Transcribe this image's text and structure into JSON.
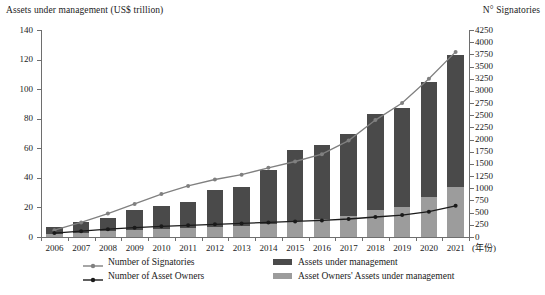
{
  "chart_data": {
    "type": "bar",
    "title": "",
    "left_axis_title": "Assets under management (US$ trillion)",
    "right_axis_title": "N° Signatories",
    "xlabel": "(年份)",
    "categories": [
      "2006",
      "2007",
      "2008",
      "2009",
      "2010",
      "2011",
      "2012",
      "2013",
      "2014",
      "2015",
      "2016",
      "2017",
      "2018",
      "2019",
      "2020",
      "2021"
    ],
    "ylim": [
      0,
      140
    ],
    "yticks": [
      0,
      20,
      40,
      60,
      80,
      100,
      120,
      140
    ],
    "ylim_right": [
      0,
      4250
    ],
    "yticks_right": [
      0,
      250,
      500,
      750,
      1000,
      1250,
      1500,
      1750,
      2000,
      2250,
      2500,
      2750,
      3000,
      3250,
      3500,
      3750,
      4000,
      4250
    ],
    "grid": false,
    "legend_position": "bottom",
    "series": [
      {
        "name": "Assets under management",
        "type": "bar",
        "axis": "left",
        "color": "#4a4a4a",
        "values": [
          6.5,
          10,
          13,
          18,
          21,
          24,
          32,
          34,
          45,
          59,
          62,
          70,
          83,
          87,
          105,
          123
        ]
      },
      {
        "name": "Asset Owners' Assets under management",
        "type": "bar",
        "axis": "left",
        "color": "#9c9c9c",
        "values": [
          2,
          3,
          4,
          5,
          5.5,
          6,
          7,
          7.5,
          9,
          11,
          12,
          14,
          18,
          20,
          27,
          34
        ]
      },
      {
        "name": "Number of Signatories",
        "type": "line",
        "axis": "right",
        "color": "#808080",
        "values": [
          140,
          300,
          480,
          680,
          880,
          1050,
          1180,
          1280,
          1420,
          1550,
          1700,
          1980,
          2400,
          2750,
          3250,
          3800
        ]
      },
      {
        "name": "Number of Asset Owners",
        "type": "line",
        "axis": "right",
        "color": "#1a1a1a",
        "values": [
          80,
          120,
          160,
          190,
          220,
          240,
          260,
          280,
          300,
          320,
          340,
          370,
          410,
          450,
          520,
          640
        ]
      }
    ]
  },
  "legend": {
    "items": [
      {
        "label": "Number of Signatories",
        "marker": "line-marker",
        "color": "#808080"
      },
      {
        "label": "Number of Asset Owners",
        "marker": "line-marker",
        "color": "#1a1a1a"
      },
      {
        "label": "Assets under management",
        "marker": "swatch",
        "color": "#4a4a4a"
      },
      {
        "label": "Asset Owners' Assets under management",
        "marker": "swatch",
        "color": "#9c9c9c"
      }
    ]
  }
}
